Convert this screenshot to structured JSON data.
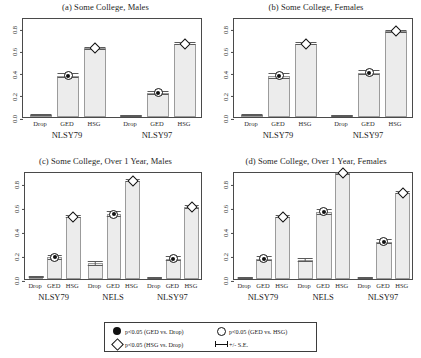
{
  "chart_data": {
    "type": "bar",
    "title": "",
    "grid": false,
    "ylim": [
      0,
      0.9
    ],
    "yticks": [
      0.0,
      0.2,
      0.4,
      0.6,
      0.8
    ],
    "ytick_labels": [
      "0.0",
      "0.2",
      "0.4",
      "0.6",
      "0.8"
    ],
    "xlabel": "",
    "ylabel": "",
    "categories": [
      "Drop",
      "GED",
      "HSG"
    ],
    "panels": [
      {
        "key": "a",
        "title": "(a) Some College, Males",
        "groups": [
          {
            "name": "NLSY79",
            "values": [
              0.02,
              0.37,
              0.62
            ],
            "errors": [
              0.008,
              0.022,
              0.014
            ],
            "markers": [
              "none",
              "filled-circle",
              "open-diamond"
            ]
          },
          {
            "name": "NLSY97",
            "values": [
              0.01,
              0.22,
              0.66
            ],
            "errors": [
              0.006,
              0.018,
              0.013
            ],
            "markers": [
              "none",
              "filled-circle",
              "open-diamond"
            ]
          }
        ]
      },
      {
        "key": "b",
        "title": "(b) Some College, Females",
        "groups": [
          {
            "name": "NLSY79",
            "values": [
              0.02,
              0.37,
              0.66
            ],
            "errors": [
              0.008,
              0.026,
              0.013
            ],
            "markers": [
              "none",
              "filled-circle",
              "open-diamond"
            ]
          },
          {
            "name": "NLSY97",
            "values": [
              0.01,
              0.4,
              0.77
            ],
            "errors": [
              0.006,
              0.023,
              0.012
            ],
            "markers": [
              "none",
              "filled-circle",
              "open-diamond"
            ]
          }
        ]
      },
      {
        "key": "c",
        "title": "(c) Some College, Over 1 Year, Males",
        "groups": [
          {
            "name": "NLSY79",
            "values": [
              0.02,
              0.18,
              0.52
            ],
            "errors": [
              0.008,
              0.02,
              0.014
            ],
            "markers": [
              "none",
              "filled-circle",
              "open-diamond"
            ]
          },
          {
            "name": "NELS",
            "values": [
              0.13,
              0.54,
              0.82
            ],
            "errors": [
              0.018,
              0.024,
              0.013
            ],
            "markers": [
              "none",
              "filled-circle",
              "open-diamond"
            ]
          },
          {
            "name": "NLSY97",
            "values": [
              0.01,
              0.17,
              0.6
            ],
            "errors": [
              0.006,
              0.018,
              0.014
            ],
            "markers": [
              "none",
              "filled-circle",
              "open-diamond"
            ]
          }
        ]
      },
      {
        "key": "d",
        "title": "(d) Some College, Over 1 Year, Females",
        "groups": [
          {
            "name": "NLSY79",
            "values": [
              0.01,
              0.17,
              0.52
            ],
            "errors": [
              0.007,
              0.021,
              0.015
            ],
            "markers": [
              "none",
              "filled-circle",
              "open-diamond"
            ]
          },
          {
            "name": "NELS",
            "values": [
              0.16,
              0.56,
              0.88
            ],
            "errors": [
              0.019,
              0.023,
              0.012
            ],
            "markers": [
              "none",
              "filled-circle",
              "open-diamond"
            ]
          },
          {
            "name": "NLSY97",
            "values": [
              0.01,
              0.31,
              0.72
            ],
            "errors": [
              0.006,
              0.022,
              0.014
            ],
            "markers": [
              "none",
              "filled-circle",
              "open-diamond"
            ]
          }
        ]
      }
    ],
    "legend": {
      "position": "bottom",
      "entries": [
        {
          "symbol": "filled-circle",
          "label": "p<0.05 (GED vs. Drop)"
        },
        {
          "symbol": "open-diamond",
          "label": "p<0.05 (HSG vs. Drop)"
        },
        {
          "symbol": "open-circle",
          "label": "p<0.05 (GED vs. HSG)"
        },
        {
          "symbol": "error-bar",
          "label": "+/- S.E."
        }
      ]
    },
    "colors": {
      "bar_fill": "#ececec",
      "bar_border": "#9b9b9b",
      "axis": "#4a4a4a",
      "marker": "#111111",
      "text": "#1a1a1a"
    }
  }
}
